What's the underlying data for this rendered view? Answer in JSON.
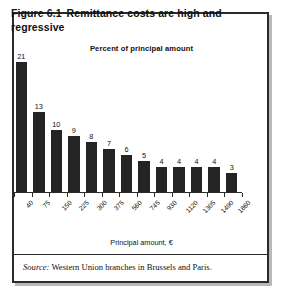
{
  "figure": {
    "number": "Figure 6.1",
    "title": "Remittance costs are high and regressive",
    "subtitle": "Percent of principal amount",
    "source_label": "Source:",
    "source_text": "Western Union branches in Brussels and Paris.",
    "border_color": "#2b2b2b",
    "background_color": "#ffffff"
  },
  "chart_data": {
    "type": "bar",
    "subtitle": "Percent of principal amount",
    "xlabel": "Principal amount, €",
    "ylabel": "Percent of principal amount",
    "categories": [
      "40",
      "75",
      "150",
      "225",
      "300",
      "375",
      "560",
      "745",
      "930",
      "1120",
      "1305",
      "1490",
      "1860"
    ],
    "values": [
      21,
      13,
      10,
      9,
      8,
      7,
      6,
      5,
      4,
      4,
      4,
      4,
      3
    ],
    "ylim": [
      0,
      21
    ],
    "grid": false,
    "legend": false,
    "bar_color": "#242424",
    "data_labels": true
  }
}
